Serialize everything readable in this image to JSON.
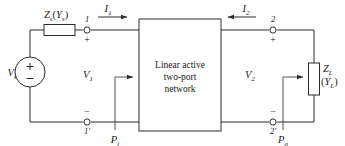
{
  "diagram": {
    "type": "circuit-schematic",
    "colors": {
      "wire": "#2b2b2b",
      "text": "#1a1a1a",
      "background": "#ffffff"
    },
    "source": {
      "label": "V",
      "sub": "s",
      "plus": "+",
      "minus": "−"
    },
    "source_impedance": {
      "label_z": "Z",
      "sub_z": "s",
      "paren_open": "(",
      "label_y": "Y",
      "sub_y": "s",
      "paren_close": ")"
    },
    "load_impedance": {
      "label_z": "Z",
      "sub_z": "L",
      "label_y_line": "(",
      "label_y": "Y",
      "sub_y": "L",
      "paren_close": ")"
    },
    "network_box": {
      "line1": "Linear active",
      "line2": "two-port",
      "line3": "network"
    },
    "currents": [
      {
        "name": "input-current",
        "label": "I",
        "sub": "1",
        "direction": "right"
      },
      {
        "name": "output-current",
        "label": "I",
        "sub": "2",
        "direction": "left"
      }
    ],
    "voltages": [
      {
        "name": "input-voltage",
        "label": "V",
        "sub": "1"
      },
      {
        "name": "output-voltage",
        "label": "V",
        "sub": "2"
      }
    ],
    "powers": [
      {
        "name": "input-power",
        "label": "P",
        "sub": "i"
      },
      {
        "name": "output-power",
        "label": "P",
        "sub": "o"
      }
    ],
    "terminals": [
      {
        "name": "terminal-1",
        "label": "1",
        "sign": "+"
      },
      {
        "name": "terminal-1p",
        "label": "1′",
        "sign": "−"
      },
      {
        "name": "terminal-2",
        "label": "2",
        "sign": "+"
      },
      {
        "name": "terminal-2p",
        "label": "2′",
        "sign": "−"
      }
    ]
  }
}
